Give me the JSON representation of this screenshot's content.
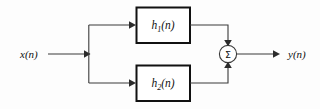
{
  "diagram": {
    "type": "block-diagram",
    "background_color": "#fdfdfd",
    "line_color": "#3a3a3a",
    "block_border_color": "#111111",
    "text_color": "#111111",
    "input": {
      "label_base": "x",
      "label_arg": "(n)",
      "label_full": "x(n)"
    },
    "output": {
      "label_base": "y",
      "label_arg": "(n)",
      "label_full": "y(n)"
    },
    "blocks": [
      {
        "id": "h1",
        "label_base": "h",
        "label_sub": "1",
        "label_arg": "(n)",
        "label_full": "h1(n)",
        "position": "top"
      },
      {
        "id": "h2",
        "label_base": "h",
        "label_sub": "2",
        "label_arg": "(n)",
        "label_full": "h2(n)",
        "position": "bottom"
      }
    ],
    "adder": {
      "symbol": "Σ",
      "shape": "circle",
      "inputs": 2
    },
    "nodes": [
      {
        "id": "branch-point",
        "kind": "split"
      }
    ]
  }
}
